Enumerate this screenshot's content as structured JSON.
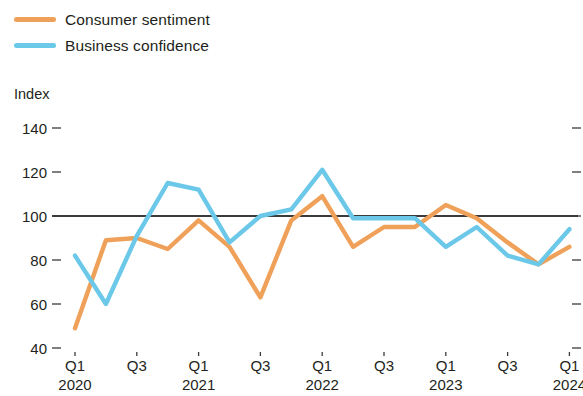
{
  "legend": {
    "position": "top-left",
    "entries": [
      {
        "label": "Consumer sentiment",
        "color": "#efa159",
        "swatch_name": "legend-swatch-consumer-sentiment"
      },
      {
        "label": "Business confidence",
        "color": "#6bc8e8",
        "swatch_name": "legend-swatch-business-confidence"
      }
    ]
  },
  "axis": {
    "y_title": "Index"
  },
  "chart_data": {
    "type": "line",
    "title": "",
    "subtitle": "",
    "xlabel": "",
    "ylabel": "Index",
    "ylim": [
      40,
      145
    ],
    "ytick_labels": [
      "140",
      "120",
      "100",
      "80",
      "60",
      "40"
    ],
    "ytick_values": [
      140,
      120,
      100,
      80,
      60,
      40
    ],
    "grid": false,
    "reference_line": {
      "value": 100,
      "color": "#3b3b3b"
    },
    "legend_position": "top-left",
    "x": [
      "Q1 2020",
      "Q2 2020",
      "Q3 2020",
      "Q4 2020",
      "Q1 2021",
      "Q2 2021",
      "Q3 2021",
      "Q4 2021",
      "Q1 2022",
      "Q2 2022",
      "Q3 2022",
      "Q4 2022",
      "Q1 2023",
      "Q2 2023",
      "Q3 2023",
      "Q4 2023",
      "Q1 2024"
    ],
    "xtick_labels": [
      {
        "quarter": "Q1",
        "year": "2020"
      },
      {
        "quarter": "Q3",
        "year": ""
      },
      {
        "quarter": "Q1",
        "year": "2021"
      },
      {
        "quarter": "Q3",
        "year": ""
      },
      {
        "quarter": "Q1",
        "year": "2022"
      },
      {
        "quarter": "Q3",
        "year": ""
      },
      {
        "quarter": "Q1",
        "year": "2023"
      },
      {
        "quarter": "Q3",
        "year": ""
      },
      {
        "quarter": "Q1",
        "year": "2024"
      }
    ],
    "series": [
      {
        "name": "Consumer sentiment",
        "color": "#efa159",
        "values": [
          49,
          89,
          90,
          85,
          98,
          86,
          63,
          98,
          109,
          86,
          95,
          95,
          105,
          99,
          88,
          78,
          86
        ]
      },
      {
        "name": "Business confidence",
        "color": "#6bc8e8",
        "values": [
          82,
          60,
          91,
          115,
          112,
          88,
          100,
          103,
          121,
          99,
          99,
          99,
          86,
          95,
          82,
          78,
          94
        ]
      }
    ]
  }
}
